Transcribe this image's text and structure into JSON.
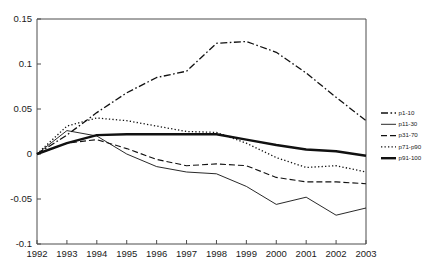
{
  "chart_data": {
    "type": "line",
    "title": "",
    "subtitle": "",
    "xlabel": "",
    "ylabel": "",
    "grid": false,
    "legend_position": "right",
    "x": [
      1992,
      1993,
      1994,
      1995,
      1996,
      1997,
      1998,
      1999,
      2000,
      2001,
      2002,
      2003
    ],
    "categories": [
      "1992",
      "1993",
      "1994",
      "1995",
      "1996",
      "1997",
      "1998",
      "1999",
      "2000",
      "2001",
      "2002",
      "2003"
    ],
    "xlim": [
      1992,
      2003
    ],
    "ylim": [
      -0.1,
      0.15
    ],
    "ytick_labels": [
      "0.15",
      "0.1",
      "0.05",
      "0",
      "-0.05",
      "-0.1"
    ],
    "ytick_values": [
      0.15,
      0.1,
      0.05,
      0,
      -0.05,
      -0.1
    ],
    "series": [
      {
        "name": "p1-10",
        "style": "dash-dot",
        "values": [
          0,
          0.021,
          0.046,
          0.068,
          0.085,
          0.092,
          0.123,
          0.125,
          0.113,
          0.09,
          0.063,
          0.037
        ]
      },
      {
        "name": "p11-30",
        "style": "solid-thin",
        "values": [
          0,
          0.026,
          0.02,
          0.0,
          -0.014,
          -0.02,
          -0.022,
          -0.036,
          -0.056,
          -0.048,
          -0.068,
          -0.06
        ]
      },
      {
        "name": "p31-70",
        "style": "dashed",
        "values": [
          0,
          0.012,
          0.016,
          0.006,
          -0.006,
          -0.013,
          -0.011,
          -0.013,
          -0.026,
          -0.031,
          -0.031,
          -0.033
        ]
      },
      {
        "name": "p71-p90",
        "style": "dotted",
        "values": [
          0,
          0.031,
          0.04,
          0.037,
          0.031,
          0.025,
          0.024,
          0.012,
          -0.004,
          -0.015,
          -0.013,
          -0.02
        ]
      },
      {
        "name": "p91-100",
        "style": "solid-thick",
        "values": [
          0,
          0.012,
          0.021,
          0.022,
          0.022,
          0.022,
          0.022,
          0.016,
          0.01,
          0.005,
          0.003,
          -0.002
        ]
      }
    ]
  },
  "legend": {
    "entries": [
      {
        "label": "p1-10",
        "style": "dash-dot"
      },
      {
        "label": "p11-30",
        "style": "solid-thin"
      },
      {
        "label": "p31-70",
        "style": "dashed"
      },
      {
        "label": "p71-p90",
        "style": "dotted"
      },
      {
        "label": "p91-100",
        "style": "solid-thick"
      }
    ]
  },
  "colors": {
    "line": "#111111",
    "axis": "#4d4d4d",
    "text": "#1a1a1a",
    "background": "#ffffff"
  }
}
